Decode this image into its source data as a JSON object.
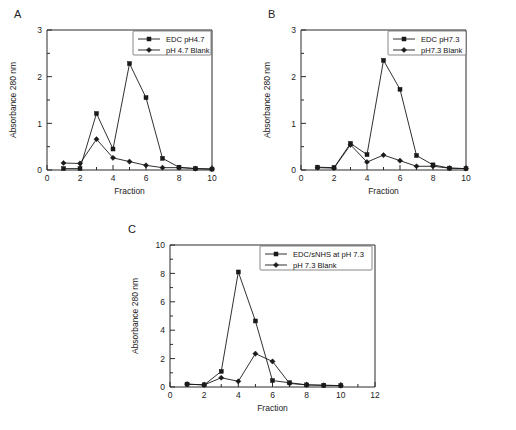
{
  "figure": {
    "panels": [
      {
        "letter": "A",
        "chart_data": {
          "type": "line",
          "title": "",
          "xlabel": "Fraction",
          "ylabel": "Absorbance 280 nm",
          "xlim": [
            0,
            10
          ],
          "ylim": [
            0,
            3
          ],
          "xticks": [
            0,
            2,
            4,
            6,
            8,
            10
          ],
          "xminor": [
            1,
            3,
            5,
            7,
            9
          ],
          "yticks": [
            0,
            1,
            2,
            3
          ],
          "yminor": [
            0.5,
            1.5,
            2.5
          ],
          "grid": false,
          "legend_position": "top-right",
          "x": [
            1,
            2,
            3,
            4,
            5,
            6,
            7,
            8,
            9,
            10
          ],
          "series": [
            {
              "name": "EDC pH4.7",
              "marker": "square",
              "values": [
                0.03,
                0.03,
                1.21,
                0.45,
                2.28,
                1.55,
                0.25,
                0.06,
                0.03,
                0.02
              ]
            },
            {
              "name": "pH 4.7 Blank",
              "marker": "diamond",
              "values": [
                0.15,
                0.14,
                0.66,
                0.26,
                0.18,
                0.1,
                0.05,
                0.05,
                0.03,
                0.02
              ]
            }
          ]
        }
      },
      {
        "letter": "B",
        "chart_data": {
          "type": "line",
          "title": "",
          "xlabel": "Fraction",
          "ylabel": "Absorbance 280 nm",
          "xlim": [
            0,
            10
          ],
          "ylim": [
            0,
            3
          ],
          "xticks": [
            0,
            2,
            4,
            6,
            8,
            10
          ],
          "xminor": [
            1,
            3,
            5,
            7,
            9
          ],
          "yticks": [
            0,
            1,
            2,
            3
          ],
          "yminor": [
            0.5,
            1.5,
            2.5
          ],
          "grid": false,
          "legend_position": "top-right",
          "x": [
            1,
            2,
            3,
            4,
            5,
            6,
            7,
            8,
            9,
            10
          ],
          "series": [
            {
              "name": "EDC pH7.3",
              "marker": "square",
              "values": [
                0.06,
                0.05,
                0.57,
                0.33,
                2.35,
                1.73,
                0.31,
                0.11,
                0.04,
                0.03
              ]
            },
            {
              "name": "pH7.3 Blank",
              "marker": "diamond",
              "values": [
                0.05,
                0.04,
                0.54,
                0.17,
                0.32,
                0.2,
                0.08,
                0.08,
                0.04,
                0.03
              ]
            }
          ]
        }
      },
      {
        "letter": "C",
        "chart_data": {
          "type": "line",
          "title": "",
          "xlabel": "Fraction",
          "ylabel": "Absorbance 280 nm",
          "xlim": [
            0,
            12
          ],
          "ylim": [
            0,
            10
          ],
          "xticks": [
            0,
            2,
            4,
            6,
            8,
            10,
            12
          ],
          "xminor": [
            1,
            3,
            5,
            7,
            9,
            11
          ],
          "yticks": [
            0,
            2,
            4,
            6,
            8,
            10
          ],
          "yminor": [
            1,
            3,
            5,
            7,
            9
          ],
          "grid": false,
          "legend_position": "top-right",
          "x": [
            1,
            2,
            3,
            4,
            5,
            6,
            7,
            8,
            9,
            10
          ],
          "series": [
            {
              "name": "EDC/sNHS at pH 7.3",
              "marker": "square",
              "values": [
                0.2,
                0.15,
                1.1,
                8.1,
                4.65,
                0.45,
                0.3,
                0.15,
                0.12,
                0.1
              ]
            },
            {
              "name": "pH 7.3 Blank",
              "marker": "diamond",
              "values": [
                0.2,
                0.15,
                0.65,
                0.4,
                2.35,
                1.8,
                0.25,
                0.15,
                0.12,
                0.1
              ]
            }
          ]
        }
      }
    ]
  }
}
